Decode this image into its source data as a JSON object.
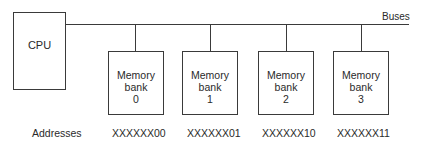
{
  "diagram": {
    "cpu": {
      "label": "CPU"
    },
    "bus": {
      "label": "Buses"
    },
    "banks": [
      {
        "line1": "Memory",
        "line2": "bank",
        "index": "0",
        "address": "XXXXXX00"
      },
      {
        "line1": "Memory",
        "line2": "bank",
        "index": "1",
        "address": "XXXXXX01"
      },
      {
        "line1": "Memory",
        "line2": "bank",
        "index": "2",
        "address": "XXXXXX10"
      },
      {
        "line1": "Memory",
        "line2": "bank",
        "index": "3",
        "address": "XXXXXX11"
      }
    ],
    "addresses_label": "Addresses"
  }
}
